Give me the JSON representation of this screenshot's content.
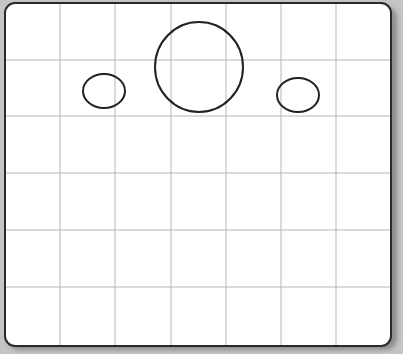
{
  "canvas": {
    "background": "#c4c4c4",
    "board_fill": "#ffffff",
    "board_border": "#2a2a2a",
    "grid_color": "#b5b5b5",
    "stroke_color": "#222222"
  },
  "grid": {
    "vertical_lines_x": [
      60,
      115,
      171,
      226,
      281,
      336
    ],
    "horizontal_lines_y": [
      60,
      116,
      173,
      230,
      287
    ]
  },
  "shapes": [
    {
      "name": "large-circle",
      "cx": 199,
      "cy": 67,
      "rx": 44,
      "ry": 45
    },
    {
      "name": "left-ellipse",
      "cx": 104,
      "cy": 91,
      "rx": 21,
      "ry": 17
    },
    {
      "name": "right-ellipse",
      "cx": 298,
      "cy": 95,
      "rx": 21,
      "ry": 17
    }
  ]
}
